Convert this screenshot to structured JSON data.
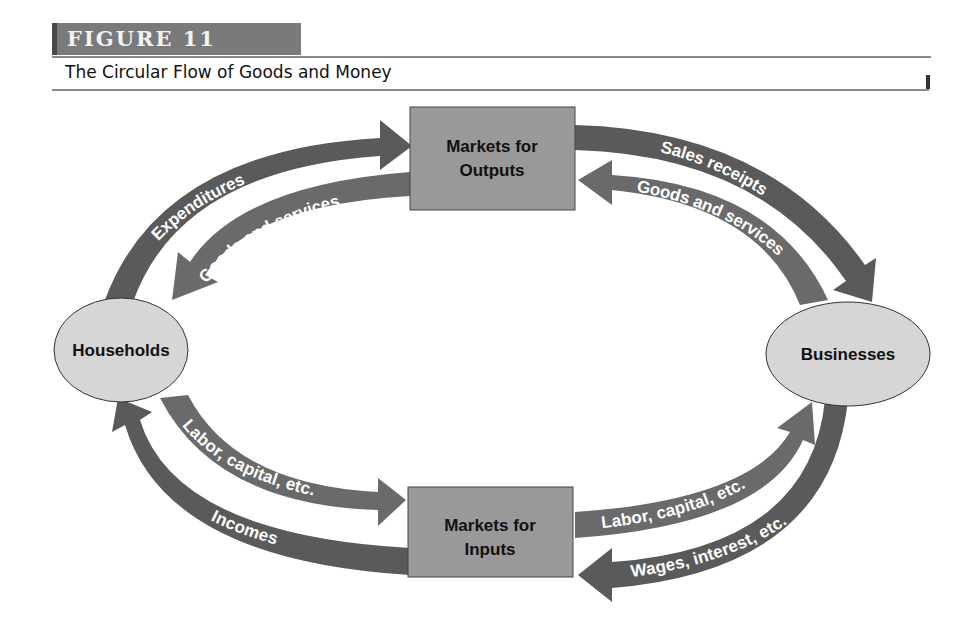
{
  "figure": {
    "number_label": "FIGURE 11",
    "title": "The Circular Flow of Goods and Money"
  },
  "colors": {
    "badge_bg": "#7a7a7a",
    "arrow_fill": "#5a5a5a",
    "box_fill": "#999999",
    "ellipse_fill": "#d6d6d6",
    "label_text": "#ffffff",
    "node_text": "#111111"
  },
  "nodes": {
    "households": {
      "label": "Households"
    },
    "businesses": {
      "label": "Businesses"
    },
    "markets_outputs": {
      "line1": "Markets for",
      "line2": "Outputs"
    },
    "markets_inputs": {
      "line1": "Markets for",
      "line2": "Inputs"
    }
  },
  "flows": {
    "expenditures": {
      "label": "Expenditures",
      "from": "Households",
      "to": "Markets for Outputs",
      "type": "money"
    },
    "goods_to_households": {
      "label": "Goods and services",
      "from": "Markets for Outputs",
      "to": "Households",
      "type": "goods"
    },
    "sales_receipts": {
      "label": "Sales receipts",
      "from": "Markets for Outputs",
      "to": "Businesses",
      "type": "money"
    },
    "goods_from_businesses": {
      "label": "Goods and services",
      "from": "Businesses",
      "to": "Markets for Outputs",
      "type": "goods"
    },
    "labor_from_households": {
      "label": "Labor, capital, etc.",
      "from": "Households",
      "to": "Markets for Inputs",
      "type": "factors"
    },
    "incomes": {
      "label": "Incomes",
      "from": "Markets for Inputs",
      "to": "Households",
      "type": "money"
    },
    "labor_to_businesses": {
      "label": "Labor, capital, etc.",
      "from": "Markets for Inputs",
      "to": "Businesses",
      "type": "factors"
    },
    "wages": {
      "label": "Wages, interest, etc.",
      "from": "Businesses",
      "to": "Markets for Inputs",
      "type": "money"
    }
  }
}
